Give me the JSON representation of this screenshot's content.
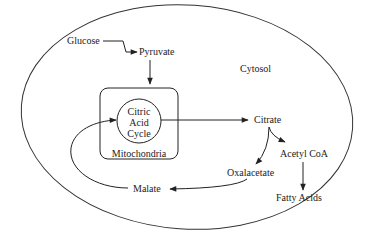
{
  "diagram": {
    "region_label": "Cytosol",
    "organelle_label": "Mitochondria",
    "cycle_label": [
      "Citric",
      "Acid",
      "Cycle"
    ],
    "nodes": {
      "glucose": "Glucose",
      "pyruvate": "Pyruvate",
      "citrate": "Citrate",
      "acetyl_coa": "Acetyl CoA",
      "oxalacetate": "Oxalacetate",
      "fatty_acids": "Fatty Acids",
      "malate": "Malate"
    },
    "edges": [
      {
        "from": "Glucose",
        "to": "Pyruvate"
      },
      {
        "from": "Pyruvate",
        "to": "Mitochondria"
      },
      {
        "from": "Citric Acid Cycle",
        "to": "Citrate"
      },
      {
        "from": "Citrate",
        "to": "Acetyl CoA"
      },
      {
        "from": "Citrate",
        "to": "Oxalacetate"
      },
      {
        "from": "Acetyl CoA",
        "to": "Fatty Acids"
      },
      {
        "from": "Oxalacetate",
        "to": "Malate"
      },
      {
        "from": "Malate",
        "to": "Citric Acid Cycle"
      }
    ],
    "colors": {
      "stroke": "#222222",
      "background": "#ffffff"
    }
  }
}
